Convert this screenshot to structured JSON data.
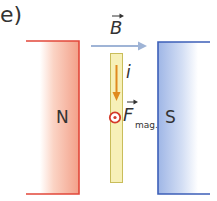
{
  "figure": {
    "part_label": "e)",
    "magnets": {
      "north": {
        "label": "N",
        "color": "#e2473a",
        "fill_color": "#f4a48e"
      },
      "south": {
        "label": "S",
        "color": "#3c5fb8",
        "fill_color": "#a9bde8"
      }
    },
    "field": {
      "symbol": "B",
      "vector": true,
      "direction": "right",
      "color": "#9fb4d6"
    },
    "conductor": {
      "fill_color": "#f5eeb0",
      "outline_color": "#c9bd5a"
    },
    "current": {
      "symbol": "i",
      "direction": "down",
      "color": "#e08a1e"
    },
    "force": {
      "symbol": "F",
      "subscript": "mag.",
      "vector": true,
      "direction": "out-of-page",
      "marker_color": "#d43a2a"
    }
  }
}
